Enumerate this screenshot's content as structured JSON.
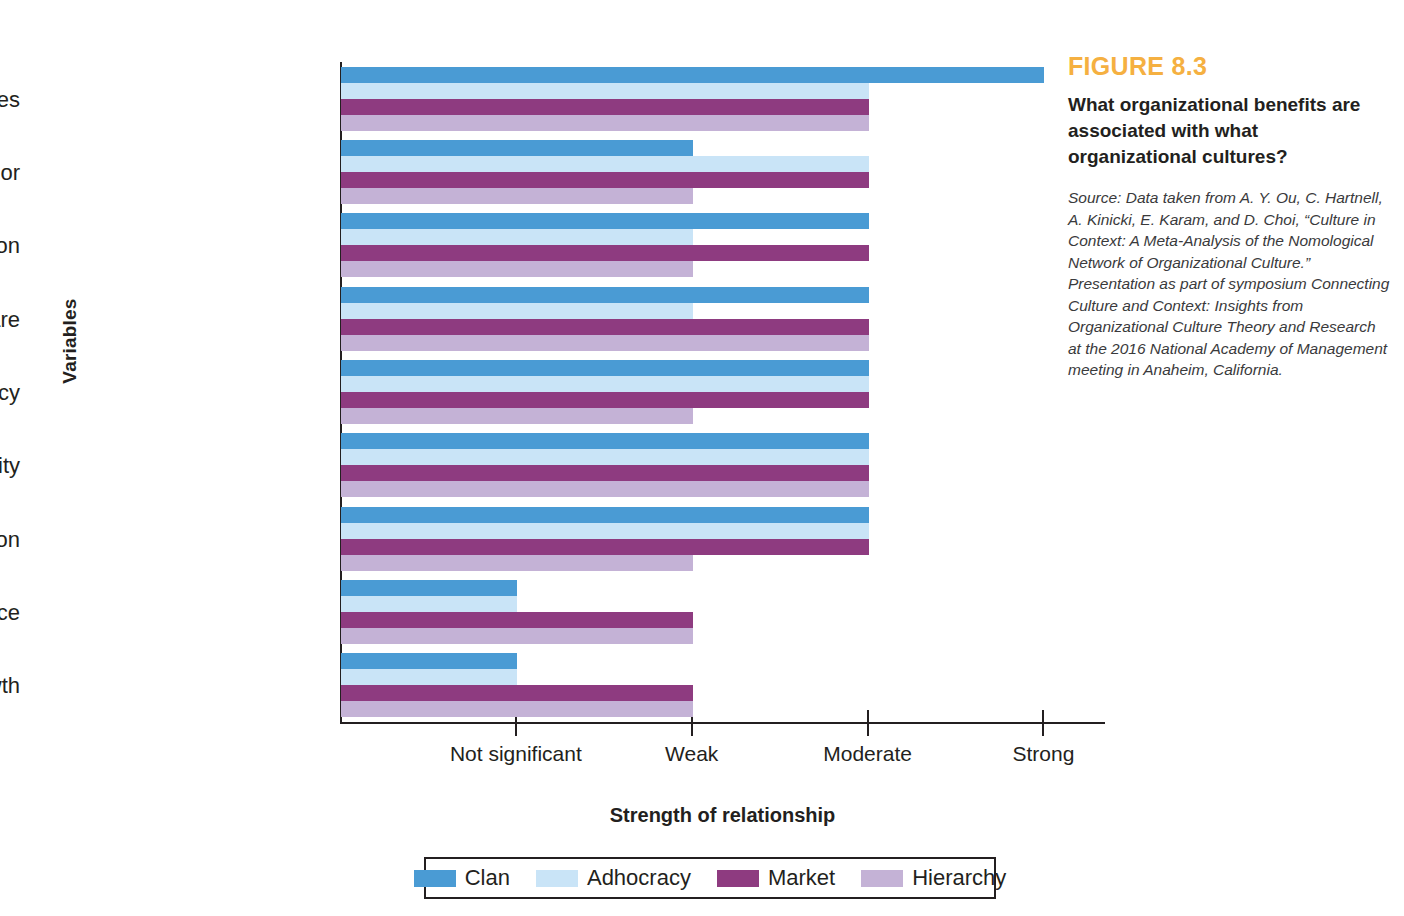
{
  "caption": {
    "figure_number": "FIGURE 8.3",
    "title": "What organizational benefits are associated with what organizational cultures?",
    "source": "Source: Data taken from A. Y. Ou, C. Hartnell, A. Kinicki, E. Karam, and D. Choi, “Culture in Context: A Meta-Analysis of the Nomological Network of Organizational Culture.” Presentation as part of symposium Connecting Culture and Context: Insights from Organizational Culture Theory and Research at the 2016 National Academy of Management meeting in Anaheim, California."
  },
  "colors": {
    "clan": "#4a9bd4",
    "adhocracy": "#c9e4f7",
    "market": "#8e3b80",
    "hierarchy": "#c4b2d6",
    "figure_number": "#f5b041",
    "axis": "#231f20"
  },
  "chart_data": {
    "type": "bar",
    "orientation": "horizontal",
    "title": "What organizational benefits are associated with what organizational cultures?",
    "xlabel": "Strength of relationship",
    "ylabel": "Variables",
    "grid": false,
    "legend_position": "bottom",
    "xticklabels": [
      "Not significant",
      "Weak",
      "Moderate",
      "Strong"
    ],
    "xtickvalues": [
      1,
      2,
      3,
      4
    ],
    "xlim": [
      0,
      4.35
    ],
    "categories": [
      "Positive work attitudes",
      "Positive employee behavior",
      "Customer satisfaction",
      "Market share",
      "Operational efficiency",
      "Product/service quality",
      "Innovation",
      "Financial performance",
      "Financial growth"
    ],
    "series": [
      {
        "name": "Clan",
        "color": "#4a9bd4",
        "values": [
          4,
          2,
          3,
          3,
          3,
          3,
          3,
          1,
          1
        ],
        "labels": [
          "Strong",
          "Weak",
          "Moderate",
          "Moderate",
          "Moderate",
          "Moderate",
          "Moderate",
          "Not significant",
          "Not significant"
        ]
      },
      {
        "name": "Adhocracy",
        "color": "#c9e4f7",
        "values": [
          3,
          3,
          2,
          2,
          3,
          3,
          3,
          1,
          1
        ],
        "labels": [
          "Moderate",
          "Moderate",
          "Weak",
          "Weak",
          "Moderate",
          "Moderate",
          "Moderate",
          "Not significant",
          "Not significant"
        ]
      },
      {
        "name": "Market",
        "color": "#8e3b80",
        "values": [
          3,
          3,
          3,
          3,
          3,
          3,
          3,
          2,
          2
        ],
        "labels": [
          "Moderate",
          "Moderate",
          "Moderate",
          "Moderate",
          "Moderate",
          "Moderate",
          "Moderate",
          "Weak",
          "Weak"
        ]
      },
      {
        "name": "Hierarchy",
        "color": "#c4b2d6",
        "values": [
          3,
          2,
          2,
          3,
          2,
          3,
          2,
          2,
          2
        ],
        "labels": [
          "Moderate",
          "Weak",
          "Weak",
          "Moderate",
          "Weak",
          "Moderate",
          "Weak",
          "Weak",
          "Weak"
        ]
      }
    ]
  }
}
